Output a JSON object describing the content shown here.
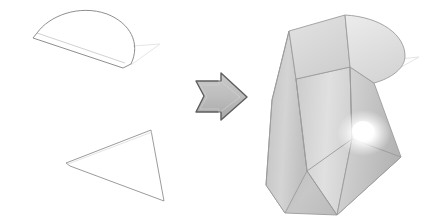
{
  "illustration": {
    "title": "Loft operation: semicircular profile and rectangular profile combined into a twisted lofted solid",
    "background_color": "#ffffff",
    "width": 439,
    "height": 217
  },
  "palette": {
    "outline_stroke": "#8a8a8a",
    "ghost_stroke": "#e2e2e2",
    "arrow_fill": "#c0c0c0",
    "arrow_stroke": "#5a5a5a",
    "face_light": "#e9e9e9",
    "face_mid": "#cfcfcf",
    "face_dark": "#bdbdbd",
    "face_top": "#dedede",
    "edge_stroke": "#9a9a9a",
    "highlight_color": "#ffffff"
  },
  "profiles": {
    "semicircle": {
      "name": "semicircular profile sketch",
      "label": "",
      "stroke": "#8a8a8a",
      "fill": "none",
      "outline_path": "M 33 38 L 123 68 L 131 65 C 140 44 130 24 107 15 C 80 5 50 16 38 33 Z",
      "ghost_path": "M 131 65 L 160 44 L 133 46"
    },
    "rectangle": {
      "name": "rectangular profile sketch",
      "label": "",
      "stroke": "#9a9a9a",
      "fill": "none",
      "outline_path": "M 66 163 L 70 165 L 162 203 L 164 201 L 155 132 L 151 130 Z",
      "corners": [
        [
          66,
          163
        ],
        [
          151,
          130
        ],
        [
          164,
          201
        ],
        [
          70,
          165
        ]
      ]
    }
  },
  "arrow": {
    "name": "transform arrow",
    "direction": "right",
    "fill": "#c0c0c0",
    "stroke": "#5a5a5a",
    "path": "M 196 82 L 222 82 L 222 74 L 246 98 L 222 120 L 222 112 L 196 112 L 204 97 Z"
  },
  "solid": {
    "name": "lofted twisted solid",
    "faces": [
      {
        "id": "top-left-cap",
        "fill": "#dcdcdc",
        "path": "M 289 32 L 345 16 L 350 68 L 296 79 Z"
      },
      {
        "id": "top-right-cap",
        "fill": "#e4e4e4",
        "path": "M 345 16 C 381 18 404 36 404 56 C 404 68 392 78 374 83 L 350 68 Z"
      },
      {
        "id": "front-left",
        "fill": "#cbcbcb",
        "path": "M 289 32 L 296 79 L 307 171 L 285 213 L 266 185 L 272 100 Z"
      },
      {
        "id": "front-center",
        "fill": "#d8d8d8",
        "path": "M 296 79 L 350 68 L 352 140 L 336 214 L 307 171 Z"
      },
      {
        "id": "front-right",
        "fill": "#c6c6c6",
        "path": "M 350 68 L 374 83 L 400 158 L 336 214 L 352 140 Z"
      },
      {
        "id": "base-skirt",
        "fill": "#bfbfbf",
        "path": "M 266 185 L 285 213 L 336 214 L 400 158 L 352 140 L 307 171 Z"
      }
    ],
    "edges": [
      "M 289 32 L 345 16",
      "M 289 32 L 296 79",
      "M 296 79 L 350 68",
      "M 345 16 L 350 68",
      "M 350 68 L 374 83",
      "M 345 16 C 381 18 404 36 404 56 C 404 68 392 78 374 83",
      "M 289 32 L 272 100 L 266 185 L 285 213",
      "M 296 79 L 307 171 L 285 213",
      "M 350 68 L 352 140 L 336 214",
      "M 374 83 L 400 158 L 336 214",
      "M 307 171 L 336 214",
      "M 285 213 L 336 214",
      "M 307 171 L 352 140",
      "M 352 140 L 400 158"
    ],
    "ghost_path": "M 374 83 L 418 58 L 389 60",
    "highlight": {
      "cx": 364,
      "cy": 133,
      "rx": 26,
      "ry": 22
    }
  }
}
